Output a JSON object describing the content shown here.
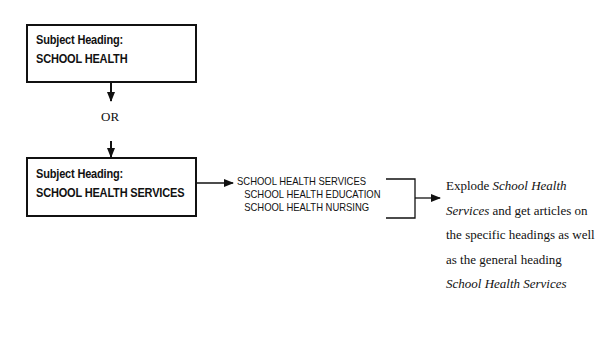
{
  "box_top": {
    "label": "Subject Heading:",
    "heading": "SCHOOL HEALTH"
  },
  "connector": {
    "label": "OR"
  },
  "box_bottom": {
    "label": "Subject Heading:",
    "heading": "SCHOOL HEALTH SERVICES"
  },
  "heading_list": {
    "items": [
      {
        "text": "SCHOOL HEALTH SERVICES",
        "level": 0
      },
      {
        "text": "SCHOOL HEALTH EDUCATION",
        "level": 1
      },
      {
        "text": "SCHOOL HEALTH NURSING",
        "level": 1
      }
    ]
  },
  "explanation": {
    "part1": "Explode ",
    "italic1": "School Health Services",
    "part2": " and get articles on the specific headings as well as the general heading ",
    "italic2": "School Health Services"
  },
  "colors": {
    "line": "#111111",
    "background": "#ffffff"
  }
}
